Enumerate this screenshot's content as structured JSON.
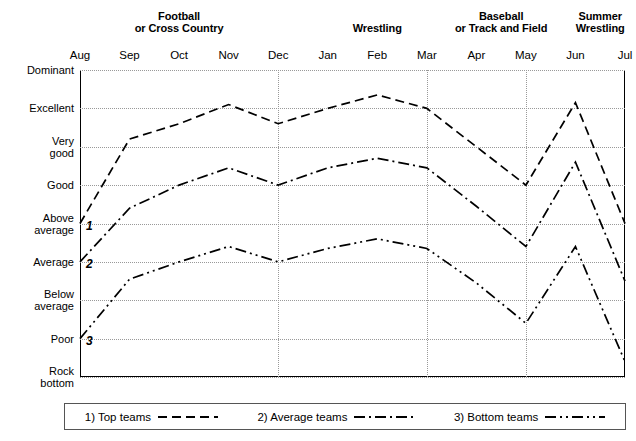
{
  "chart_data": {
    "type": "line",
    "title": "",
    "xlabel": "",
    "ylabel": "",
    "grid": true,
    "legend_position": "bottom",
    "x": [
      "Aug",
      "Sep",
      "Oct",
      "Nov",
      "Dec",
      "Jan",
      "Feb",
      "Mar",
      "Apr",
      "May",
      "Jun",
      "Jul"
    ],
    "categories": [
      "Aug",
      "Sep",
      "Oct",
      "Nov",
      "Dec",
      "Jan",
      "Feb",
      "Mar",
      "Apr",
      "May",
      "Jun",
      "Jul"
    ],
    "ylim": [
      0,
      8
    ],
    "ytick_labels": [
      "Dominant",
      "Excellent",
      "Very good",
      "Good",
      "Above average",
      "Average",
      "Below average",
      "Poor",
      "Rock bottom"
    ],
    "ytick_values": [
      8,
      7,
      6,
      5,
      4,
      3,
      2,
      1,
      0
    ],
    "seasons": [
      {
        "label": "Football\nor Cross Country",
        "line1": "Football",
        "line2": "or Cross Country",
        "from": "Aug",
        "to": "Dec"
      },
      {
        "label": "Wrestling",
        "line1": "Wrestling",
        "line2": "",
        "from": "Jan",
        "to": "Mar"
      },
      {
        "label": "Baseball\nor Track and Field",
        "line1": "Baseball",
        "line2": "or Track and Field",
        "from": "Apr",
        "to": "May"
      },
      {
        "label": "Summer\nWrestling",
        "line1": "Summer",
        "line2": "Wrestling",
        "from": "Jun",
        "to": "Jul"
      }
    ],
    "season_dividers": [
      "Dec",
      "Mar",
      "May"
    ],
    "series": [
      {
        "name": "1) Top teams",
        "marker": "1",
        "style": "dashed",
        "values": [
          4.0,
          6.2,
          6.6,
          7.1,
          6.6,
          7.0,
          7.35,
          7.0,
          6.0,
          5.0,
          7.15,
          4.0
        ],
        "value_labels": [
          "Above average",
          "Very good",
          "Very good",
          "Excellent",
          "Excellent",
          "Excellent",
          "Excellent",
          "Excellent",
          "Very good",
          "Good",
          "Excellent",
          "Above average"
        ]
      },
      {
        "name": "2) Average teams",
        "marker": "2",
        "style": "dash-dot",
        "values": [
          3.0,
          4.4,
          5.0,
          5.45,
          5.0,
          5.45,
          5.7,
          5.45,
          4.45,
          3.4,
          5.6,
          2.5
        ],
        "value_labels": [
          "Average",
          "Good",
          "Good",
          "Very good",
          "Good",
          "Very good",
          "Very good",
          "Very good",
          "Good",
          "Average",
          "Very good",
          "Average"
        ]
      },
      {
        "name": "3) Bottom teams",
        "marker": "3",
        "style": "dash-dot-dot",
        "values": [
          1.0,
          2.55,
          3.0,
          3.4,
          3.0,
          3.35,
          3.6,
          3.35,
          2.45,
          1.4,
          3.4,
          0.4
        ],
        "value_labels": [
          "Poor",
          "Average",
          "Average",
          "Average",
          "Average",
          "Average",
          "Average",
          "Average",
          "Below average",
          "Poor",
          "Average",
          "Rock bottom"
        ]
      }
    ]
  },
  "legend": {
    "items": [
      {
        "label": "1) Top teams",
        "style": "dashed"
      },
      {
        "label": "2) Average teams",
        "style": "dash-dot"
      },
      {
        "label": "3) Bottom teams",
        "style": "dash-dot-dot"
      }
    ]
  }
}
